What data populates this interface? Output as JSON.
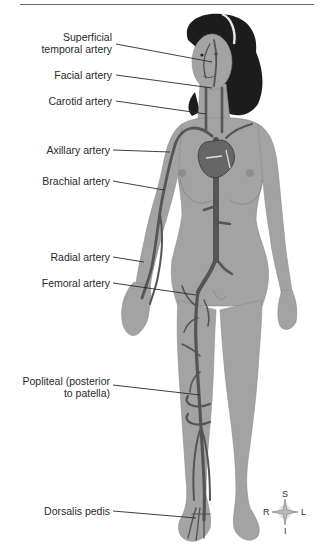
{
  "diagram": {
    "labels": [
      {
        "id": "superficial-temporal",
        "text_line1": "Superficial",
        "text_line2": "temporal artery"
      },
      {
        "id": "facial",
        "text": "Facial artery"
      },
      {
        "id": "carotid",
        "text": "Carotid artery"
      },
      {
        "id": "axillary",
        "text": "Axillary artery"
      },
      {
        "id": "brachial",
        "text": "Brachial artery"
      },
      {
        "id": "radial",
        "text": "Radial artery"
      },
      {
        "id": "femoral",
        "text": "Femoral artery"
      },
      {
        "id": "popliteal",
        "text_line1": "Popliteal (posterior",
        "text_line2": "to patella)"
      },
      {
        "id": "dorsalis-pedis",
        "text": "Dorsalis pedis"
      }
    ],
    "compass": {
      "superior": "S",
      "inferior": "I",
      "right": "R",
      "left": "L"
    },
    "colors": {
      "skin": "#a3a3a3",
      "skin_shadow": "#8e8e8e",
      "artery": "#555555",
      "hair": "#1c1c1c",
      "leader_line": "#2a2a2a",
      "text": "#2a2a2a"
    }
  }
}
